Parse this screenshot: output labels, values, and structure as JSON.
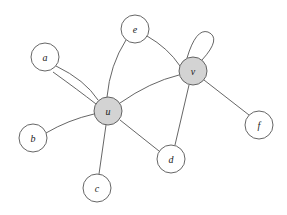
{
  "diagram": {
    "type": "graph",
    "nodes": [
      {
        "id": "a",
        "label": "a",
        "x": 45,
        "y": 57,
        "shaded": false
      },
      {
        "id": "e",
        "label": "e",
        "x": 135,
        "y": 29,
        "shaded": false
      },
      {
        "id": "v",
        "label": "v",
        "x": 193,
        "y": 71,
        "shaded": true
      },
      {
        "id": "u",
        "label": "u",
        "x": 108,
        "y": 111,
        "shaded": true
      },
      {
        "id": "b",
        "label": "b",
        "x": 33,
        "y": 138,
        "shaded": false
      },
      {
        "id": "c",
        "label": "c",
        "x": 97,
        "y": 188,
        "shaded": false
      },
      {
        "id": "d",
        "label": "d",
        "x": 171,
        "y": 159,
        "shaded": false
      },
      {
        "id": "f",
        "label": "f",
        "x": 259,
        "y": 125,
        "shaded": false
      }
    ],
    "edges": [
      {
        "from": "a",
        "to": "u",
        "multiplicity": 2
      },
      {
        "from": "e",
        "to": "u"
      },
      {
        "from": "e",
        "to": "v"
      },
      {
        "from": "u",
        "to": "v"
      },
      {
        "from": "u",
        "to": "b"
      },
      {
        "from": "u",
        "to": "c"
      },
      {
        "from": "u",
        "to": "d"
      },
      {
        "from": "v",
        "to": "d"
      },
      {
        "from": "v",
        "to": "f"
      },
      {
        "from": "v",
        "to": "v",
        "loop": true
      }
    ],
    "colors": {
      "shaded_node": "#d3d3d3",
      "stroke": "#555555"
    }
  }
}
